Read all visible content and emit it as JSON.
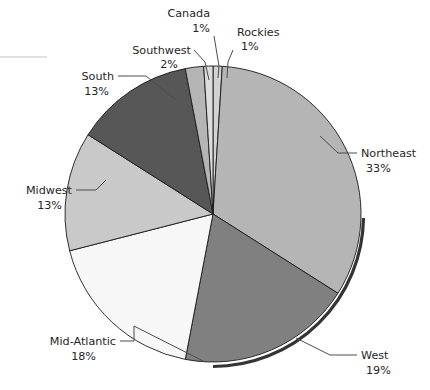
{
  "chart_data": {
    "type": "pie",
    "title": "",
    "subtitle": "",
    "xlabel": "",
    "ylabel": "",
    "legend_position": "none",
    "grid": false,
    "value_unit": "%",
    "start_angle_deg": 0,
    "direction": "clockwise",
    "categories": [
      "Rockies",
      "Northeast",
      "West",
      "Mid-Atlantic",
      "Midwest",
      "South",
      "Southwest",
      "Canada"
    ],
    "values": [
      1,
      33,
      19,
      18,
      13,
      13,
      2,
      1
    ],
    "labels": [
      "Rockies 1%",
      "Northeast 33%",
      "West 19%",
      "Mid-Atlantic 18%",
      "Midwest 13%",
      "South 13%",
      "Southwest 2%",
      "Canada 1%"
    ],
    "colors": [
      "#d2d2d2",
      "#b5b5b5",
      "#808080",
      "#f7f7f7",
      "#c9c9c9",
      "#575757",
      "#b5b5b5",
      "#dcdcdc"
    ],
    "slices": [
      {
        "name": "Rockies",
        "value": 1,
        "value_label": "1%",
        "color": "#d2d2d2",
        "label_x": 237,
        "label_y": 36,
        "val_x": 237,
        "val_y": 50,
        "anchor": "start"
      },
      {
        "name": "Northeast",
        "value": 33,
        "value_label": "33%",
        "color": "#b5b5b5",
        "label_x": 361,
        "label_y": 157,
        "val_x": 361,
        "val_y": 172,
        "anchor": "start"
      },
      {
        "name": "West",
        "value": 19,
        "value_label": "19%",
        "color": "#808080",
        "label_x": 361,
        "label_y": 359,
        "val_x": 361,
        "val_y": 374,
        "anchor": "start"
      },
      {
        "name": "Mid-Atlantic",
        "value": 18,
        "value_label": "18%",
        "color": "#f7f7f7",
        "label_x": 116,
        "label_y": 345,
        "val_x": 116,
        "val_y": 360,
        "anchor": "end"
      },
      {
        "name": "Midwest",
        "value": 13,
        "value_label": "13%",
        "color": "#c9c9c9",
        "label_x": 72,
        "label_y": 194,
        "val_x": 72,
        "val_y": 209,
        "anchor": "end"
      },
      {
        "name": "South",
        "value": 13,
        "value_label": "13%",
        "color": "#575757",
        "label_x": 114,
        "label_y": 80,
        "val_x": 114,
        "val_y": 95,
        "anchor": "end"
      },
      {
        "name": "Southwest",
        "value": 2,
        "value_label": "2%",
        "color": "#b5b5b5",
        "label_x": 191,
        "label_y": 54,
        "val_x": 191,
        "val_y": 68,
        "anchor": "end"
      },
      {
        "name": "Canada",
        "value": 1,
        "value_label": "1%",
        "color": "#dcdcdc",
        "label_x": 210,
        "label_y": 17,
        "val_x": 210,
        "val_y": 32,
        "anchor": "end"
      }
    ],
    "geometry": {
      "cx": 213,
      "cy": 214,
      "r": 148
    }
  }
}
